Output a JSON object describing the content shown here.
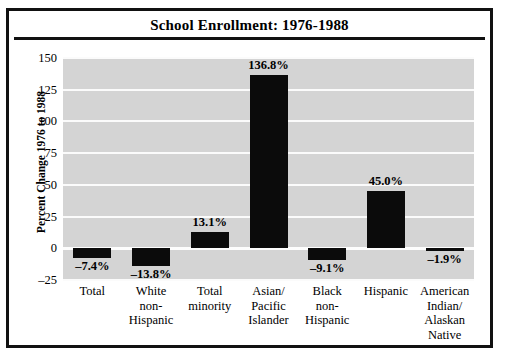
{
  "chart_data": {
    "type": "bar",
    "title": "School Enrollment: 1976-1988",
    "xlabel": "",
    "ylabel": "Percent Change 1976 to 1988",
    "ylim": [
      -25,
      150
    ],
    "yticks": [
      150,
      125,
      100,
      75,
      50,
      25,
      0,
      -25
    ],
    "ytick_labels": [
      "150",
      "125",
      "100",
      "75",
      "50",
      "25",
      "0",
      "–25"
    ],
    "grid": true,
    "legend": "none",
    "bar_color": "#0b0b0b",
    "plot_background": "#d4d4d4",
    "categories": [
      "Total",
      "White non-Hispanic",
      "Total minority",
      "Asian/Pacific Islander",
      "Black non-Hispanic",
      "Hispanic",
      "American Indian/Alaskan Native"
    ],
    "category_label_lines": [
      [
        "Total"
      ],
      [
        "White",
        "non-",
        "Hispanic"
      ],
      [
        "Total",
        "minority"
      ],
      [
        "Asian/",
        "Pacific",
        "Islander"
      ],
      [
        "Black",
        "non-",
        "Hispanic"
      ],
      [
        "Hispanic"
      ],
      [
        "American",
        "Indian/",
        "Alaskan",
        "Native"
      ]
    ],
    "values": [
      -7.4,
      -13.8,
      13.1,
      136.8,
      -9.1,
      45.0,
      -1.9
    ],
    "data_labels": [
      "–7.4%",
      "–13.8%",
      "13.1%",
      "136.8%",
      "–9.1%",
      "45.0%",
      "–1.9%"
    ]
  }
}
